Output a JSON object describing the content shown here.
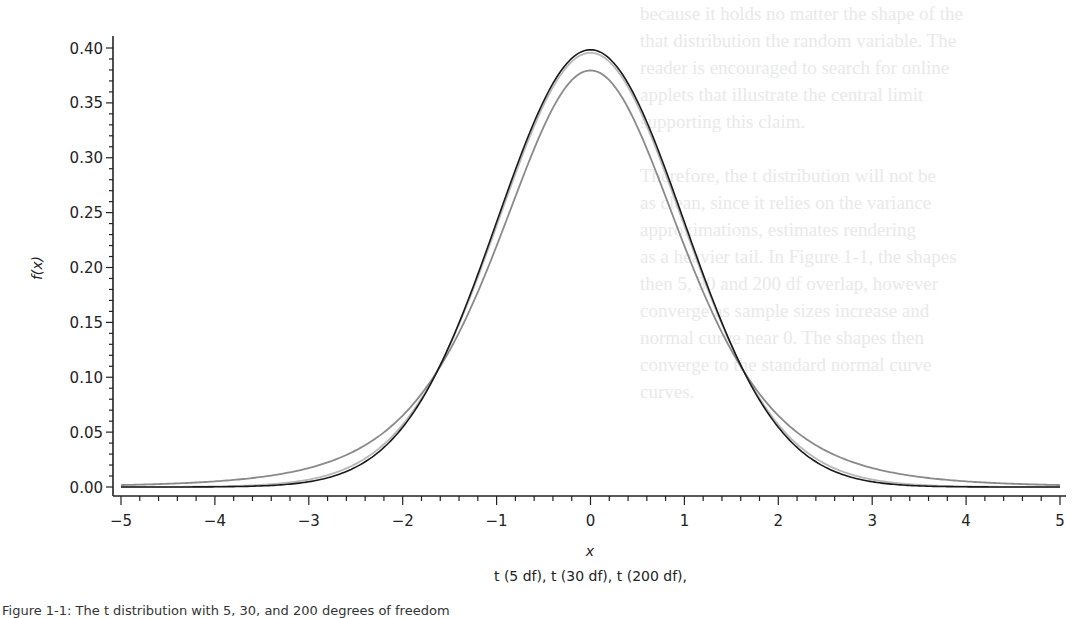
{
  "chart_data": {
    "type": "line",
    "title": "",
    "xlabel": "x",
    "ylabel": "f(x)",
    "xlim": [
      -5,
      5
    ],
    "ylim": [
      0.0,
      0.4
    ],
    "grid": false,
    "legend_position": "bottom (caption text)",
    "legend_text": "t (5 df), t (30 df), t (200 df),",
    "x_ticks": [
      "-5",
      "-4",
      "-3",
      "-2",
      "-1",
      "0",
      "1",
      "2",
      "3",
      "4",
      "5"
    ],
    "y_ticks": [
      "0.00",
      "0.05",
      "0.10",
      "0.15",
      "0.20",
      "0.25",
      "0.30",
      "0.35",
      "0.40"
    ],
    "x": [
      -5,
      -4.5,
      -4,
      -3.5,
      -3,
      -2.5,
      -2,
      -1.5,
      -1,
      -0.5,
      0,
      0.5,
      1,
      1.5,
      2,
      2.5,
      3,
      3.5,
      4,
      4.5,
      5
    ],
    "series": [
      {
        "name": "t (5 df)",
        "df": 5,
        "color": "#8a8a8a",
        "values": [
          0.0018,
          0.0032,
          0.0051,
          0.0086,
          0.0173,
          0.0329,
          0.0651,
          0.1245,
          0.2197,
          0.3279,
          0.3796,
          0.3279,
          0.2197,
          0.1245,
          0.0651,
          0.0329,
          0.0173,
          0.0086,
          0.0051,
          0.0032,
          0.0018
        ]
      },
      {
        "name": "t (30 df)",
        "df": 30,
        "color": "#b8b8b8",
        "values": [
          0.0,
          0.0001,
          0.0004,
          0.0014,
          0.0051,
          0.0167,
          0.0551,
          0.1282,
          0.236,
          0.3473,
          0.3956,
          0.3473,
          0.236,
          0.1282,
          0.0551,
          0.0167,
          0.0051,
          0.0014,
          0.0004,
          0.0001,
          0.0
        ]
      },
      {
        "name": "t (200 df)",
        "df": 200,
        "color": "#1a1a1a",
        "values": [
          0.0,
          0.0,
          0.0002,
          0.001,
          0.0046,
          0.0177,
          0.0542,
          0.1297,
          0.2416,
          0.3516,
          0.3984,
          0.3516,
          0.2416,
          0.1297,
          0.0542,
          0.0177,
          0.0046,
          0.001,
          0.0002,
          0.0,
          0.0
        ]
      }
    ]
  },
  "figure": {
    "legend_caption": "t (5 df), t (30 df), t (200 df),",
    "figure_caption": "Figure 1-1: The t distribution with 5, 30, and 200 degrees of freedom"
  }
}
